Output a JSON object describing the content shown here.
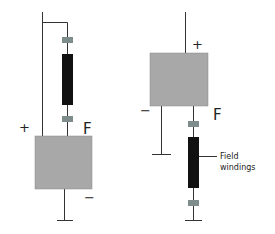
{
  "left_circuit": {
    "plus_label": "+",
    "minus_label": "−",
    "field_label": "F"
  },
  "right_circuit": {
    "plus_label": "+",
    "minus_label": "−",
    "field_label": "F",
    "callout": "Field\nwindings"
  },
  "colors": {
    "box_fill": "#a8a8a8",
    "winding_fill": "#111111",
    "connector_fill": "#7f8c8c",
    "wire": "#333333"
  }
}
